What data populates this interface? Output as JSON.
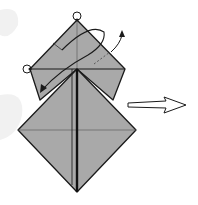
{
  "diagram": {
    "type": "origami-step",
    "colors": {
      "paper": "#a9a9a9",
      "stroke": "#1a1a1a",
      "background": "#ffffff",
      "watermark": "#eeeeee"
    },
    "markers": {
      "reference_points": [
        {
          "name": "top-point-circle",
          "x": 77,
          "y": 16
        },
        {
          "name": "left-point-circle",
          "x": 28,
          "y": 69
        }
      ]
    },
    "arrows": [
      {
        "name": "fold-arrow",
        "kind": "curved-valley-fold",
        "from": [
          104,
          30
        ],
        "to": [
          42,
          90
        ]
      },
      {
        "name": "unfold-arrow",
        "kind": "curved-small",
        "from": [
          110,
          52
        ],
        "to": [
          122,
          32
        ]
      },
      {
        "name": "next-step-arrow",
        "kind": "hollow-right",
        "from": [
          128,
          105
        ],
        "to": [
          186,
          105
        ]
      }
    ]
  }
}
